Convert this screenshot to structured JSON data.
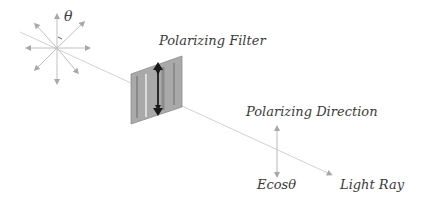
{
  "diagram": {
    "labels": {
      "theta": "θ",
      "filter": "Polarizing Filter",
      "direction": "Polarizing Direction",
      "component": "Ecosθ",
      "ray": "Light Ray"
    },
    "colors": {
      "ray": "#d0d0d0",
      "arrows": "#a8a8a8",
      "filter_face": "#a6a6a6",
      "filter_dark": "#2a2a2a",
      "text": "#3a3a3a"
    }
  }
}
